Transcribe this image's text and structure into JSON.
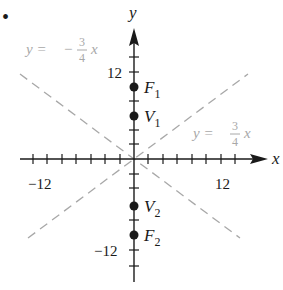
{
  "figure": {
    "marker": "•",
    "axes": {
      "x_label": "x",
      "y_label": "y",
      "x_tick_labels": {
        "neg": "−12",
        "pos": "12"
      },
      "y_tick_labels": {
        "pos": "12",
        "neg": "−12"
      },
      "tick_step_units": 2,
      "range": [
        -14,
        14
      ]
    },
    "asymptotes": [
      {
        "label_lhs": "y = ",
        "sign": "−",
        "num": "3",
        "den": "4",
        "var": "x",
        "slope": -0.75
      },
      {
        "label_lhs": "y = ",
        "sign": "",
        "num": "3",
        "den": "4",
        "var": "x",
        "slope": 0.75
      }
    ],
    "points": [
      {
        "name": "F",
        "sub": "1",
        "x": 0,
        "y": 10
      },
      {
        "name": "V",
        "sub": "1",
        "x": 0,
        "y": 6
      },
      {
        "name": "V",
        "sub": "2",
        "x": 0,
        "y": -6
      },
      {
        "name": "F",
        "sub": "2",
        "x": 0,
        "y": -10
      }
    ],
    "colors": {
      "axis": "#1a1a1a",
      "asymptote": "#a8a8a8",
      "point": "#1a1a1a"
    }
  }
}
